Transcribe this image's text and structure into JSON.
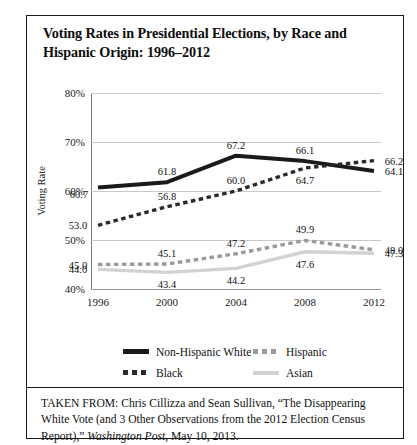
{
  "title": "Voting Rates in Presidential Elections, by Race and Hispanic Origin: 1996–2012",
  "source": {
    "prefix": "TAKEN FROM: Chris Cillizza and Sean Sullivan, “The Disappearing White Vote (and 3 Other Observations from the 2012 Election Census Report),” ",
    "publication": "Washington Post",
    "suffix": ", May 10, 2013."
  },
  "legend": [
    {
      "label": "Non-Hispanic White",
      "style": "solid-thick",
      "color": "#1a1a1a"
    },
    {
      "label": "Hispanic",
      "style": "dashed",
      "color": "#9a9a9a"
    },
    {
      "label": "Black",
      "style": "dashed",
      "color": "#2a2a2a"
    },
    {
      "label": "Asian",
      "style": "solid-thin",
      "color": "#d2d2d2"
    }
  ],
  "chart_data": {
    "type": "line",
    "title": "Voting Rates in Presidential Elections, by Race and Hispanic Origin: 1996–2012",
    "xlabel": "",
    "ylabel": "Voting Rate",
    "categories": [
      "1996",
      "2000",
      "2004",
      "2008",
      "2012"
    ],
    "x": [
      1996,
      2000,
      2004,
      2008,
      2012
    ],
    "ylim": [
      40,
      80
    ],
    "yticks": [
      40,
      50,
      60,
      70,
      80
    ],
    "ytick_labels": [
      "40%",
      "50%",
      "60%",
      "70%",
      "80%"
    ],
    "grid": true,
    "legend_position": "bottom",
    "series": [
      {
        "name": "Non-Hispanic White",
        "color": "#1a1a1a",
        "style": "solid-thick",
        "values": [
          60.7,
          61.8,
          67.2,
          66.1,
          64.1
        ],
        "label_positions": [
          "below-left",
          "above",
          "above",
          "above",
          "right"
        ]
      },
      {
        "name": "Black",
        "color": "#2a2a2a",
        "style": "dashed",
        "values": [
          53.0,
          56.8,
          60.0,
          64.7,
          66.2
        ],
        "label_positions": [
          "left",
          "above",
          "above",
          "below",
          "right"
        ]
      },
      {
        "name": "Hispanic",
        "color": "#9a9a9a",
        "style": "dashed",
        "values": [
          45.0,
          45.1,
          47.2,
          49.9,
          48.0
        ],
        "label_positions": [
          "left",
          "above",
          "above",
          "above",
          "right"
        ]
      },
      {
        "name": "Asian",
        "color": "#d2d2d2",
        "style": "solid-thin",
        "values": [
          44.0,
          43.4,
          44.2,
          47.6,
          47.3
        ],
        "label_positions": [
          "left",
          "below",
          "below",
          "below",
          "right"
        ]
      }
    ]
  }
}
